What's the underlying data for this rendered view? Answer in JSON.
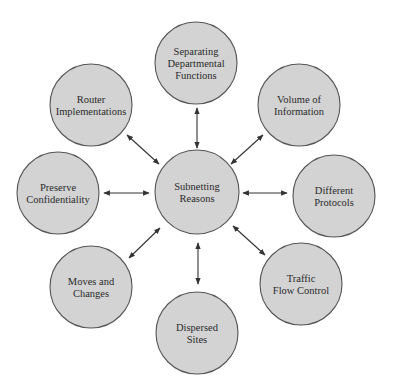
{
  "diagram": {
    "type": "hub-and-spoke",
    "center": {
      "id": "subnetting-reasons",
      "lines": [
        "Subnetting",
        "Reasons"
      ]
    },
    "nodes": [
      {
        "id": "separating-departmental-functions",
        "lines": [
          "Separating",
          "Departmental",
          "Functions"
        ]
      },
      {
        "id": "volume-of-information",
        "lines": [
          "Volume of",
          "Information"
        ]
      },
      {
        "id": "different-protocols",
        "lines": [
          "Different",
          "Protocols"
        ]
      },
      {
        "id": "traffic-flow-control",
        "lines": [
          "Traffic",
          "Flow Control"
        ]
      },
      {
        "id": "dispersed-sites",
        "lines": [
          "Dispersed",
          "Sites"
        ]
      },
      {
        "id": "moves-and-changes",
        "lines": [
          "Moves and",
          "Changes"
        ]
      },
      {
        "id": "preserve-confidentiality",
        "lines": [
          "Preserve",
          "Confidentiality"
        ]
      },
      {
        "id": "router-implementations",
        "lines": [
          "Router",
          "Implementations"
        ]
      }
    ],
    "edges": "bidirectional arrows from center to each node",
    "colors": {
      "fill": "#d3d3d3",
      "stroke": "#555555",
      "arrow": "#333333",
      "text": "#2a2a2a"
    }
  }
}
